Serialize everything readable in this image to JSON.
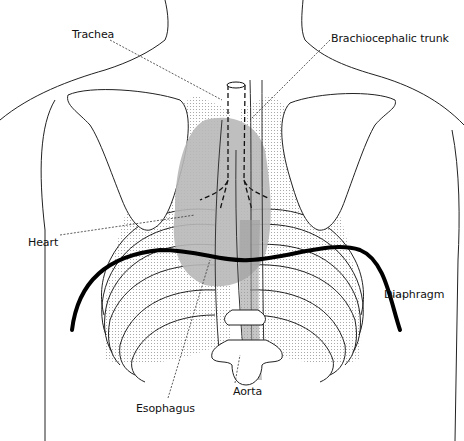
{
  "figure": {
    "labels": {
      "trachea": "Trachea",
      "brachiocephalic_trunk": "Brachiocephalic trunk",
      "heart": "Heart",
      "diaphragm": "Diaphragm",
      "aorta": "Aorta",
      "esophagus": "Esophagus"
    },
    "colors": {
      "line": "#1a1a1a",
      "heart_fill": "#b5b5b5",
      "lung_stipple": "#cfcfcf",
      "diaphragm": "#000000",
      "background": "#ffffff"
    }
  }
}
